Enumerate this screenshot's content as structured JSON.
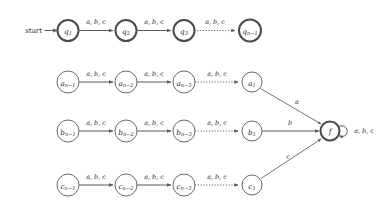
{
  "diagram": {
    "type": "finite-automaton",
    "title": "",
    "alphabet": [
      "a",
      "b",
      "c"
    ],
    "start_label": "start",
    "colors": {
      "background": "#ffffff",
      "stroke": "#5a5a5a",
      "stroke_emphasis": "#4a4a4a",
      "text": "#2a2a2a"
    },
    "transition_label": "a, b, c",
    "accepting_state": "f",
    "rows": [
      {
        "id": "q-chain",
        "emphasis": true,
        "states": [
          {
            "id": "q1",
            "base": "q",
            "sub": "1"
          },
          {
            "id": "q2",
            "base": "q",
            "sub": "2"
          },
          {
            "id": "q3",
            "base": "q",
            "sub": "3"
          },
          {
            "id": "qn1",
            "base": "q",
            "sub": "n−1"
          }
        ],
        "edges": [
          {
            "from": "q1",
            "to": "q2",
            "label": "a, b, c",
            "style": "solid"
          },
          {
            "from": "q2",
            "to": "q3",
            "label": "a, b, c",
            "style": "solid"
          },
          {
            "from": "q3",
            "to": "qn1",
            "label": "a, b, c",
            "style": "dotted"
          }
        ]
      },
      {
        "id": "a-chain",
        "emphasis": false,
        "states": [
          {
            "id": "an1",
            "base": "a",
            "sub": "n−1"
          },
          {
            "id": "an2",
            "base": "a",
            "sub": "n−2"
          },
          {
            "id": "an3",
            "base": "a",
            "sub": "n−3"
          },
          {
            "id": "a1",
            "base": "a",
            "sub": "1"
          }
        ],
        "edges": [
          {
            "from": "an1",
            "to": "an2",
            "label": "a, b, c",
            "style": "solid"
          },
          {
            "from": "an2",
            "to": "an3",
            "label": "a, b, c",
            "style": "solid"
          },
          {
            "from": "an3",
            "to": "a1",
            "label": "a, b, c",
            "style": "dotted"
          }
        ],
        "final_edge": {
          "from": "a1",
          "to": "f",
          "label": "a"
        }
      },
      {
        "id": "b-chain",
        "emphasis": false,
        "states": [
          {
            "id": "bn1",
            "base": "b",
            "sub": "n−1"
          },
          {
            "id": "bn2",
            "base": "b",
            "sub": "n−2"
          },
          {
            "id": "bn3",
            "base": "b",
            "sub": "n−3"
          },
          {
            "id": "b1",
            "base": "b",
            "sub": "1"
          }
        ],
        "edges": [
          {
            "from": "bn1",
            "to": "bn2",
            "label": "a, b, c",
            "style": "solid"
          },
          {
            "from": "bn2",
            "to": "bn3",
            "label": "a, b, c",
            "style": "solid"
          },
          {
            "from": "bn3",
            "to": "b1",
            "label": "a, b, c",
            "style": "dotted"
          }
        ],
        "final_edge": {
          "from": "b1",
          "to": "f",
          "label": "b"
        }
      },
      {
        "id": "c-chain",
        "emphasis": false,
        "states": [
          {
            "id": "cn1",
            "base": "c",
            "sub": "n−1"
          },
          {
            "id": "cn2",
            "base": "c",
            "sub": "n−2"
          },
          {
            "id": "cn3",
            "base": "c",
            "sub": "n−3"
          },
          {
            "id": "c1",
            "base": "c",
            "sub": "1"
          }
        ],
        "edges": [
          {
            "from": "cn1",
            "to": "cn2",
            "label": "a, b, c",
            "style": "solid"
          },
          {
            "from": "cn2",
            "to": "cn3",
            "label": "a, b, c",
            "style": "solid"
          },
          {
            "from": "cn3",
            "to": "c1",
            "label": "a, b, c",
            "style": "dotted"
          }
        ],
        "final_edge": {
          "from": "c1",
          "to": "f",
          "label": "c"
        }
      }
    ],
    "final_state": {
      "id": "f",
      "base": "f",
      "sub": ""
    },
    "self_loop_label": "a, b, c"
  }
}
